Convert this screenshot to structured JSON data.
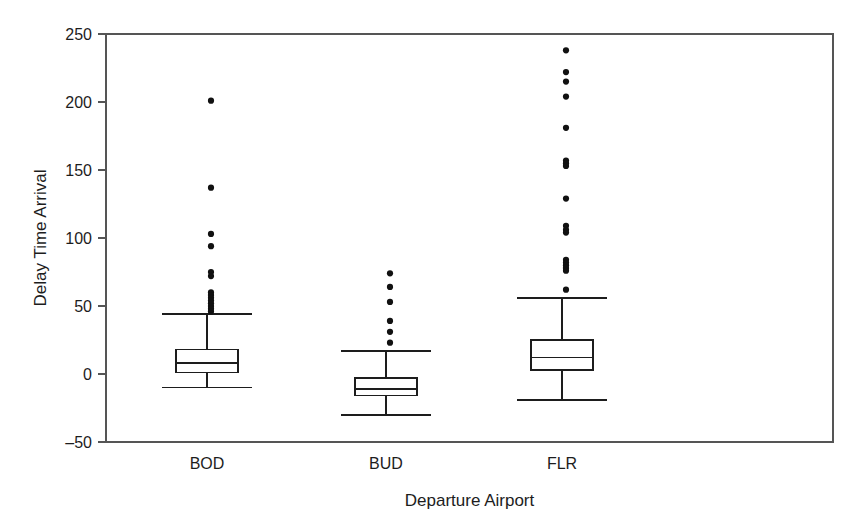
{
  "chart_data": {
    "type": "box",
    "title": "",
    "xlabel": "Departure Airport",
    "ylabel": "Delay Time Arrival",
    "categories": [
      "BOD",
      "BUD",
      "FLR"
    ],
    "ylim": [
      -50,
      250
    ],
    "yticks": [
      -50,
      0,
      50,
      100,
      150,
      200,
      250
    ],
    "ytick_labels": [
      "–50",
      "0",
      "50",
      "100",
      "150",
      "200",
      "250"
    ],
    "grid": false,
    "legend": false,
    "boxes": [
      {
        "category": "BOD",
        "whisker_low": -10,
        "q1": 1,
        "median": 8,
        "q3": 18,
        "whisker_high": 44,
        "outliers": [
          201,
          137,
          103,
          94,
          75,
          72,
          60,
          58,
          56,
          54,
          52,
          50,
          48,
          46
        ]
      },
      {
        "category": "BUD",
        "whisker_low": -30,
        "q1": -16,
        "median": -11,
        "q3": -3,
        "whisker_high": 17,
        "outliers": [
          74,
          64,
          53,
          39,
          31,
          23
        ]
      },
      {
        "category": "FLR",
        "whisker_low": -19,
        "q1": 3,
        "median": 12,
        "q3": 25,
        "whisker_high": 56,
        "outliers": [
          238,
          222,
          215,
          204,
          181,
          157,
          155,
          153,
          129,
          109,
          106,
          104,
          84,
          82,
          80,
          78,
          76,
          62
        ]
      }
    ]
  },
  "axes": {
    "ylabel": "Delay Time Arrival",
    "xlabel": "Departure Airport",
    "ytick_labels": [
      "250",
      "200",
      "150",
      "100",
      "50",
      "0",
      "–50"
    ],
    "xtick_labels": [
      "BOD",
      "BUD",
      "FLR"
    ]
  },
  "style": {
    "line_color": "#1d1d1d",
    "frame_color": "#555555",
    "marker_color": "#111111",
    "background": "#ffffff"
  }
}
